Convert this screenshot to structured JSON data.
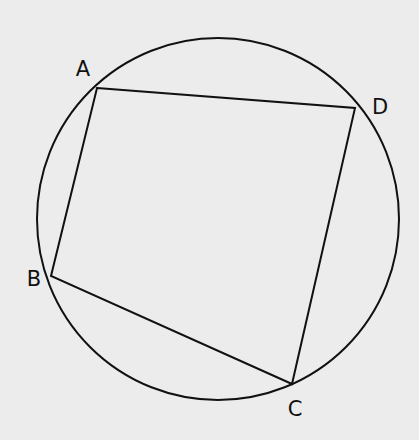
{
  "figure": {
    "type": "cyclic-quadrilateral",
    "background": "#ececec",
    "stroke_color": "#111111",
    "circle": {
      "cx": 218,
      "cy": 219,
      "r": 181
    },
    "vertices": [
      {
        "label": "A",
        "x": 97,
        "y": 88,
        "label_x": 83,
        "label_y": 76
      },
      {
        "label": "D",
        "x": 355,
        "y": 108,
        "label_x": 380,
        "label_y": 114
      },
      {
        "label": "C",
        "x": 292,
        "y": 384,
        "label_x": 295,
        "label_y": 416
      },
      {
        "label": "B",
        "x": 51,
        "y": 276,
        "label_x": 34,
        "label_y": 286
      }
    ],
    "sides": [
      [
        "A",
        "D"
      ],
      [
        "D",
        "C"
      ],
      [
        "C",
        "B"
      ],
      [
        "B",
        "A"
      ]
    ]
  }
}
